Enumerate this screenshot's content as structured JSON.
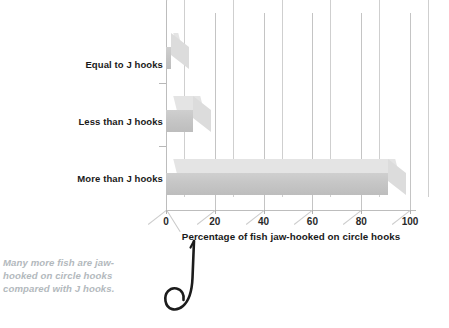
{
  "chart_data": {
    "type": "bar",
    "orientation": "horizontal",
    "title": "",
    "xlabel": "Percentage of fish jaw-hooked on circle hooks",
    "ylabel": "",
    "categories": [
      "Equal to J hooks",
      "Less than J hooks",
      "More than J hooks"
    ],
    "values": [
      2,
      11,
      91
    ],
    "xlim": [
      0,
      100
    ],
    "xticks": [
      0,
      20,
      40,
      60,
      80,
      100
    ],
    "xtick_labels": [
      "0",
      "20",
      "40",
      "60",
      "80",
      "100"
    ],
    "grid": true,
    "legend": false,
    "style_3d": true,
    "bar_color": "#c6c6c6",
    "bar_top_color": "#e4e4e4",
    "gridline_color": "#c4c4c4",
    "axis_color": "#bdbdbd",
    "series": [
      {
        "name": "Percentage of fish jaw-hooked on circle hooks",
        "values": [
          2,
          11,
          91
        ]
      }
    ]
  },
  "caption": {
    "text": "Many more fish are jaw-hooked on circle hooks compared with J hooks.",
    "color": "#b3b9bd"
  },
  "illustration": {
    "name": "fish-hook-icon",
    "description": "J-shaped fishing hook with barbed point"
  }
}
